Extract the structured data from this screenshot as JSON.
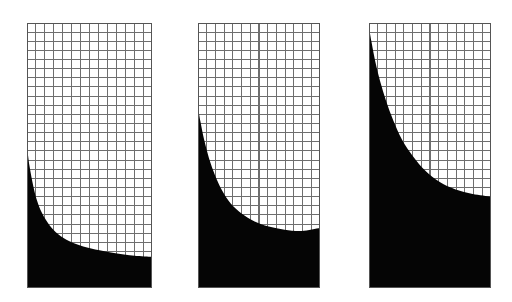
{
  "figure": {
    "type": "multi-panel-figure",
    "background_color": "#ffffff",
    "width": 512,
    "height": 302,
    "panel_count": 3,
    "grid_line_color": "#6e6e6e",
    "fill_color": "#050505",
    "plot_background_color": "#ffffff",
    "border_color": "#555555",
    "grid_cell_px": 9.0
  },
  "chart_data": {
    "type": "area",
    "title": "",
    "subtitle": "",
    "xlabel": "",
    "ylabel": "",
    "grid": true,
    "legend_position": "none",
    "panel_layout": "1x3",
    "shared_description": "Three gridded panels, each filled black beneath a monotonically decreasing hyperbolic decay curve; the filled fraction increases from the left panel to the right panel.",
    "panels": [
      {
        "name": "panel-1",
        "index": 0,
        "label": "",
        "rect": {
          "x": 27,
          "y": 23,
          "width": 125,
          "height": 265
        },
        "grid_cols": 14,
        "grid_rows": 29,
        "fill_fraction": 0.18,
        "axis_ranges": {
          "xlim": [
            0,
            1
          ],
          "ylim": [
            0,
            1
          ]
        },
        "curve": {
          "name": "decay-curve",
          "shape": "hyperbolic-decay",
          "x": [
            0.0,
            0.02,
            0.05,
            0.08,
            0.12,
            0.18,
            0.25,
            0.34,
            0.45,
            0.58,
            0.72,
            0.86,
            1.0
          ],
          "y": [
            0.535,
            0.46,
            0.385,
            0.33,
            0.283,
            0.237,
            0.203,
            0.176,
            0.157,
            0.142,
            0.13,
            0.122,
            0.118
          ],
          "left_endpoint_px": {
            "x": 27,
            "y": 165
          },
          "right_endpoint_px": {
            "x": 152,
            "y": 257
          }
        }
      },
      {
        "name": "panel-2",
        "index": 1,
        "label": "",
        "rect": {
          "x": 198,
          "y": 23,
          "width": 122,
          "height": 265
        },
        "grid_cols": 14,
        "grid_rows": 29,
        "fill_fraction": 0.36,
        "axis_ranges": {
          "xlim": [
            0,
            1
          ],
          "ylim": [
            0,
            1
          ]
        },
        "curve": {
          "name": "decay-curve",
          "shape": "hyperbolic-decay",
          "x": [
            0.0,
            0.02,
            0.05,
            0.09,
            0.14,
            0.2,
            0.27,
            0.36,
            0.46,
            0.58,
            0.71,
            0.85,
            1.0
          ],
          "y": [
            0.683,
            0.628,
            0.56,
            0.49,
            0.425,
            0.366,
            0.318,
            0.28,
            0.252,
            0.232,
            0.22,
            0.215,
            0.226
          ],
          "left_endpoint_px": {
            "x": 198,
            "y": 107
          },
          "right_endpoint_px": {
            "x": 320,
            "y": 228
          }
        }
      },
      {
        "name": "panel-3",
        "index": 2,
        "label": "",
        "rect": {
          "x": 369,
          "y": 23,
          "width": 122,
          "height": 265
        },
        "grid_cols": 14,
        "grid_rows": 29,
        "fill_fraction": 0.62,
        "axis_ranges": {
          "xlim": [
            0,
            1
          ],
          "ylim": [
            0,
            1
          ]
        },
        "curve": {
          "name": "decay-curve",
          "shape": "hyperbolic-decay",
          "x": [
            0.0,
            0.02,
            0.05,
            0.09,
            0.14,
            0.2,
            0.27,
            0.36,
            0.46,
            0.58,
            0.71,
            0.85,
            1.0
          ],
          "y": [
            0.983,
            0.93,
            0.858,
            0.782,
            0.706,
            0.631,
            0.56,
            0.497,
            0.443,
            0.4,
            0.372,
            0.355,
            0.345
          ],
          "left_endpoint_px": {
            "x": 369,
            "y": 28
          },
          "right_endpoint_px": {
            "x": 491,
            "y": 197
          }
        }
      }
    ]
  }
}
